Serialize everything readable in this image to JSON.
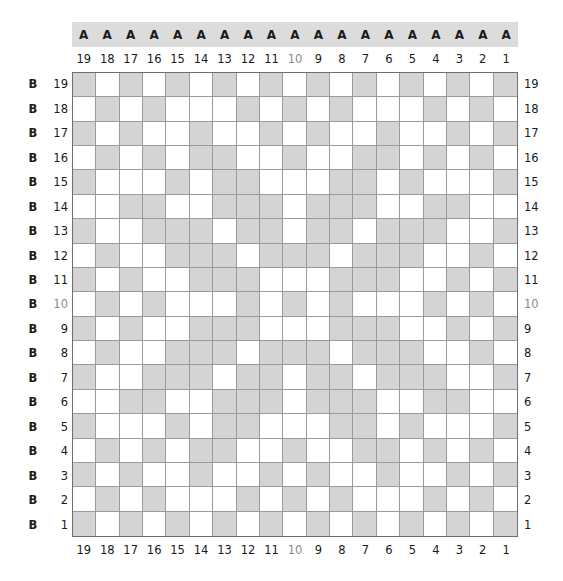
{
  "header": {
    "row_letter": "A",
    "cells": [
      "A",
      "A",
      "A",
      "A",
      "A",
      "A",
      "A",
      "A",
      "A",
      "A",
      "A",
      "A",
      "A",
      "A",
      "A",
      "A",
      "A",
      "A",
      "A"
    ]
  },
  "columns": [
    "19",
    "18",
    "17",
    "16",
    "15",
    "14",
    "13",
    "12",
    "11",
    "10",
    "9",
    "8",
    "7",
    "6",
    "5",
    "4",
    "3",
    "2",
    "1"
  ],
  "rows": [
    "19",
    "18",
    "17",
    "16",
    "15",
    "14",
    "13",
    "12",
    "11",
    "10",
    "9",
    "8",
    "7",
    "6",
    "5",
    "4",
    "3",
    "2",
    "1"
  ],
  "row_prefix": "B",
  "muted_label": "10",
  "colors": {
    "shaded": "#d4d4d4",
    "empty": "#ffffff",
    "header_band": "#dcdcdc",
    "grid_line": "#9a9a9a",
    "border": "#6e6e6e",
    "muted_label": "#8a8a8a"
  },
  "grid": {
    "description": "19x19 grid; rows listed top (19) to bottom (1); columns listed left (19) to right (1); 1 = shaded",
    "cells": [
      "1010101010101010101",
      "0101000101010001010",
      "1010010010100100101",
      "0101011001001101010",
      "1000101100011010001",
      "0011001110111001100",
      "1001110110110111001",
      "0100111011101110010",
      "1010011100011100101",
      "0101000101010001010",
      "1010011100011100101",
      "0100111011101110010",
      "1001110110110111001",
      "0011001110111001100",
      "1000101100011010001",
      "0101011001001101010",
      "1010010010100100101",
      "0101000101010001010",
      "1010101010101010101"
    ]
  }
}
